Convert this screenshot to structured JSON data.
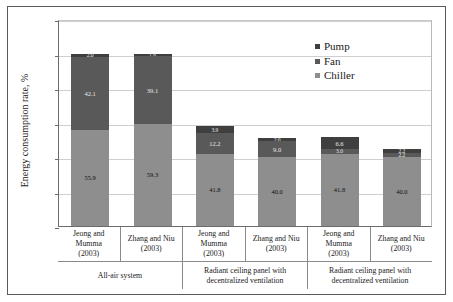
{
  "chart_data": {
    "type": "bar",
    "stacked": true,
    "title": "",
    "xlabel": "",
    "ylabel": "Energy consumption rate, %",
    "ylim": [
      0,
      120
    ],
    "yticks": [
      0,
      20,
      40,
      60,
      80,
      100,
      120
    ],
    "grid": true,
    "legend_position": "top-right",
    "legend": [
      "Pump",
      "Fan",
      "Chiller"
    ],
    "categories": [
      "Jeong and Mumma (2003)",
      "Zhang and Niu (2003)",
      "Jeong and Mumma (2003)",
      "Zhang and Niu (2003)",
      "Jeong and Mumma (2003)",
      "Zhang and Niu (2003)"
    ],
    "group_labels": [
      "All-air system",
      "Radiant ceiling panel with decentralized ventilation",
      "Radiant ceiling panel with decentralized ventilation"
    ],
    "series": [
      {
        "name": "Chiller",
        "color": "#8e8e8e",
        "values": [
          55.9,
          59.3,
          41.8,
          40.0,
          41.8,
          40.0
        ]
      },
      {
        "name": "Fan",
        "color": "#595959",
        "values": [
          42.1,
          39.1,
          12.2,
          9.0,
          3.0,
          2.2
        ]
      },
      {
        "name": "Pump",
        "color": "#3f3f3f",
        "values": [
          2.0,
          1.6,
          3.9,
          2.0,
          6.6,
          2.2
        ]
      }
    ],
    "bar_totals": [
      100.0,
      100.0,
      57.9,
      51.0,
      51.4,
      44.4
    ],
    "data_labels": {
      "chiller": [
        "55.9",
        "59.3",
        "41.8",
        "40.0",
        "41.8",
        "40.0"
      ],
      "fan": [
        "42.1",
        "39.1",
        "12.2",
        "9.0",
        "3.0",
        "2.2"
      ],
      "pump": [
        "2.0",
        "1.6",
        "3.9",
        "2.0",
        "6.6",
        "2.2"
      ]
    }
  },
  "axis": {
    "y_title": "Energy consumption rate, %",
    "y_ticks": [
      "120",
      "100",
      "80",
      "60",
      "40",
      "20",
      "0"
    ]
  },
  "legend": {
    "items": [
      {
        "label": "Pump",
        "color": "#3f3f3f"
      },
      {
        "label": "Fan",
        "color": "#595959"
      },
      {
        "label": "Chiller",
        "color": "#8e8e8e"
      }
    ]
  },
  "xaxis": {
    "groups": [
      {
        "group_label": "All-air system",
        "cells": [
          {
            "author": "Jeong and Mumma",
            "year": "(2003)"
          },
          {
            "author": "Zhang and Niu",
            "year": "(2003)"
          }
        ]
      },
      {
        "group_label": "Radiant ceiling panel with decentralized ventilation",
        "cells": [
          {
            "author": "Jeong and Mumma",
            "year": "(2003)"
          },
          {
            "author": "Zhang and Niu",
            "year": "(2003)"
          }
        ]
      },
      {
        "group_label": "Radiant ceiling panel with decentralized ventilation",
        "cells": [
          {
            "author": "Jeong and Mumma",
            "year": "(2003)"
          },
          {
            "author": "Zhang and Niu",
            "year": "(2003)"
          }
        ]
      }
    ]
  }
}
